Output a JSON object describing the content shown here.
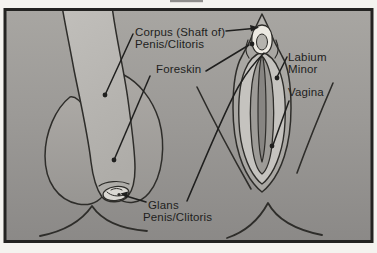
{
  "diagram": {
    "labels": {
      "corpus_line1": "Corpus (Shaft of)",
      "corpus_line2": "Penis/Clitoris",
      "foreskin": "Foreskin",
      "labium_line1": "Labium",
      "labium_line2": "Minor",
      "vagina": "Vagina",
      "glans_line1": "Glans",
      "glans_line2": "Penis/Clitoris"
    },
    "palette": {
      "paper_margin": "#f4f3ef",
      "frame_border": "#232321",
      "background_top": "#a8a6a2",
      "background_bottom": "#8b8987",
      "shaft_fill": "#b9b7b3",
      "scrotum_fill": "#a3a19d",
      "labia_minor_fill": "#c5c3bf",
      "vestibule_fill": "#9d9b97",
      "slit_fill": "#878582",
      "glans_white": "#ece9e2",
      "ink": "#24231f"
    }
  }
}
